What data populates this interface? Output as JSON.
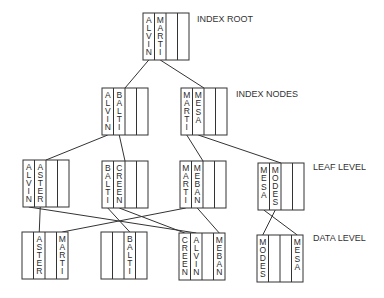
{
  "colors": {
    "line": "#333333",
    "text": "#2a2a2a",
    "background": "#ffffff"
  },
  "level_labels": {
    "root": "INDEX ROOT",
    "index": "INDEX NODES",
    "leaf": "LEAF LEVEL",
    "data": "DATA LEVEL"
  },
  "nodes": [
    {
      "id": "root",
      "level": "root",
      "cells": [
        "ALVIN",
        "MARTI",
        "",
        ""
      ]
    },
    {
      "id": "idx1",
      "level": "index",
      "cells": [
        "ALVIN",
        "BALTI",
        "",
        ""
      ]
    },
    {
      "id": "idx2",
      "level": "index",
      "cells": [
        "MARTI",
        "MESA",
        "",
        ""
      ]
    },
    {
      "id": "leaf1",
      "level": "leaf",
      "cells": [
        "ALVIN",
        "ASTER",
        "",
        ""
      ]
    },
    {
      "id": "leaf2",
      "level": "leaf",
      "cells": [
        "BALTI",
        "CREEN",
        "",
        ""
      ]
    },
    {
      "id": "leaf3",
      "level": "leaf",
      "cells": [
        "MARTI",
        "MEBAN",
        "",
        ""
      ]
    },
    {
      "id": "leaf4",
      "level": "leaf",
      "cells": [
        "MESA",
        "MODES",
        "",
        ""
      ]
    },
    {
      "id": "data1",
      "level": "data",
      "cells": [
        "",
        "ASTER",
        "",
        "MARTI"
      ]
    },
    {
      "id": "data2",
      "level": "data",
      "cells": [
        "",
        "",
        "BALTI",
        ""
      ]
    },
    {
      "id": "data3",
      "level": "data",
      "cells": [
        "CREEN",
        "ALVIN",
        "",
        "MEBAN"
      ]
    },
    {
      "id": "data4",
      "level": "data",
      "cells": [
        "MODES",
        "",
        "",
        "MESA"
      ]
    }
  ],
  "edges": [
    {
      "from": "root",
      "from_cell": 0,
      "to": "idx1"
    },
    {
      "from": "root",
      "from_cell": 1,
      "to": "idx2"
    },
    {
      "from": "idx1",
      "from_cell": 0,
      "to": "leaf1"
    },
    {
      "from": "idx1",
      "from_cell": 1,
      "to": "leaf2"
    },
    {
      "from": "idx2",
      "from_cell": 0,
      "to": "leaf3"
    },
    {
      "from": "idx2",
      "from_cell": 1,
      "to": "leaf4"
    },
    {
      "from": "leaf1",
      "from_cell": 0,
      "to": "data3",
      "to_cell": 1
    },
    {
      "from": "leaf1",
      "from_cell": 1,
      "to": "data1",
      "to_cell": 1
    },
    {
      "from": "leaf2",
      "from_cell": 0,
      "to": "data2",
      "to_cell": 2
    },
    {
      "from": "leaf2",
      "from_cell": 1,
      "to": "data3",
      "to_cell": 0
    },
    {
      "from": "leaf3",
      "from_cell": 0,
      "to": "data1",
      "to_cell": 3
    },
    {
      "from": "leaf3",
      "from_cell": 1,
      "to": "data3",
      "to_cell": 3
    },
    {
      "from": "leaf4",
      "from_cell": 0,
      "to": "data4",
      "to_cell": 3
    },
    {
      "from": "leaf4",
      "from_cell": 1,
      "to": "data4",
      "to_cell": 0
    }
  ]
}
